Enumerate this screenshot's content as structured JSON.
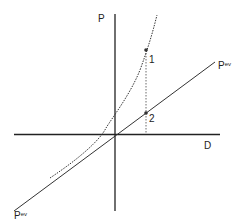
{
  "diagram": {
    "axes": {
      "y_label": "P",
      "x_label": "D"
    },
    "line_label": {
      "base": "P",
      "sup": "ev"
    },
    "points": [
      {
        "label": "1",
        "curve": "dotted-curve"
      },
      {
        "label": "2",
        "curve": "straight-line"
      }
    ],
    "colors": {
      "stroke": "#222222",
      "background": "#ffffff"
    }
  }
}
